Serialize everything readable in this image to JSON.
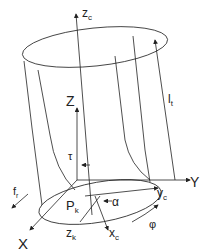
{
  "diagram": {
    "labels": {
      "zc": "z",
      "zc_sub": "c",
      "Z": "Z",
      "lt": "l",
      "lt_sub": "t",
      "tau": "τ",
      "Y": "Y",
      "fr": "f",
      "fr_sub": "r",
      "Pk": "P",
      "Pk_sub": "k",
      "alpha": "α",
      "yc": "y",
      "yc_sub": "c",
      "phi": "φ",
      "X": "X",
      "zk": "z",
      "zk_sub": "k",
      "xc": "x",
      "xc_sub": "c"
    },
    "colors": {
      "stroke": "#222222",
      "background": "#ffffff"
    }
  }
}
